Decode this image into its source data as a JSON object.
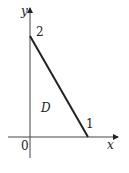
{
  "diagram": {
    "type": "region-in-plane",
    "axes": {
      "x_label": "x",
      "y_label": "y",
      "origin_label": "0"
    },
    "line": {
      "from": {
        "x": 0,
        "y": 2
      },
      "to": {
        "x": 1,
        "y": 0
      }
    },
    "labels": {
      "y_intercept": "2",
      "x_intercept": "1",
      "region": "D"
    },
    "colors": {
      "stroke": "#222222",
      "background": "#ffffff"
    }
  }
}
